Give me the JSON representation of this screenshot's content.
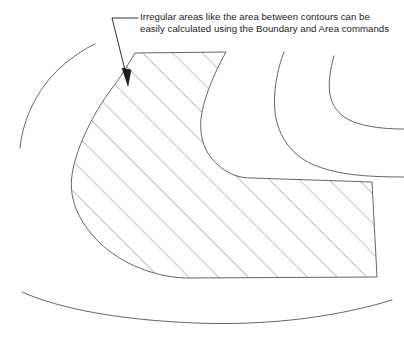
{
  "diagram": {
    "background_color": "#ffffff",
    "annotation": {
      "line1": "Irregular areas like the area between contours can be",
      "line2": "easily calculated using the Boundary and Area commands",
      "text_color": "#1b1b1b",
      "leader_color": "#1b1b1b",
      "arrow_target": "hatched-region"
    },
    "hatched_region": {
      "label": "Boundary hatch fill",
      "hatch_color": "#6e6e6e",
      "hatch_angle_degrees": 45,
      "hatch_spacing_px": 21,
      "outline_color": "#555555",
      "fill_color": "#ffffff"
    },
    "contours": [
      {
        "name": "contour-left",
        "color": "#555555"
      },
      {
        "name": "contour-top-right-outer",
        "color": "#555555"
      },
      {
        "name": "contour-top-right-inner",
        "color": "#555555"
      },
      {
        "name": "contour-bottom",
        "color": "#555555"
      }
    ]
  }
}
